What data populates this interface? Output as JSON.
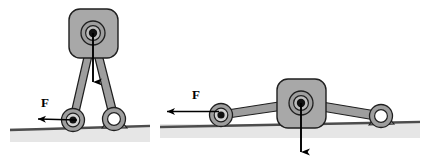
{
  "figure": {
    "background_color": "#ffffff",
    "link_fill": "#9e9e9e",
    "link_stroke": "#1a1a1a",
    "block_fill": "#a8a8a8",
    "block_stroke": "#1a1a1a",
    "ground_line_color": "#555555",
    "ground_shade_color": "#e2e2e2",
    "arrow_color": "#000000",
    "hub_dark_color": "#111111",
    "hub_light_color": "#ffffff"
  },
  "panels": [
    {
      "id": "left-panel",
      "name": "upright-configuration",
      "force_label": "F",
      "force_arrow": {
        "direction": "left",
        "tail_x": 77,
        "tail_y": 120,
        "head_x": 34,
        "head_y": 119
      },
      "weight_arrow": {
        "direction": "down",
        "tail_x": 93,
        "tail_y": 33,
        "head_x": 93,
        "head_y": 87
      },
      "pivot": {
        "x": 93,
        "y": 33,
        "type": "filled-hub"
      },
      "roller_joint": {
        "x": 73,
        "y": 120,
        "type": "filled-hub"
      },
      "pin_support": {
        "x": 114,
        "y": 120,
        "type": "open-ring"
      },
      "ground": {
        "x1": 10,
        "x2": 150,
        "y": 128
      }
    },
    {
      "id": "right-panel",
      "name": "flattened-configuration",
      "force_label": "F",
      "force_arrow": {
        "direction": "left",
        "tail_x": 219,
        "tail_y": 111,
        "head_x": 163,
        "head_y": 111
      },
      "weight_arrow": {
        "direction": "down",
        "tail_x": 301,
        "tail_y": 103,
        "head_x": 301,
        "head_y": 158
      },
      "pivot": {
        "x": 301,
        "y": 103,
        "type": "filled-hub"
      },
      "roller_joint": {
        "x": 221,
        "y": 115,
        "type": "filled-hub"
      },
      "pin_support": {
        "x": 381,
        "y": 117,
        "type": "open-ring"
      },
      "ground": {
        "x1": 160,
        "x2": 420,
        "y": 125
      }
    }
  ],
  "labels": {
    "left_force": "F",
    "right_force": "F"
  }
}
